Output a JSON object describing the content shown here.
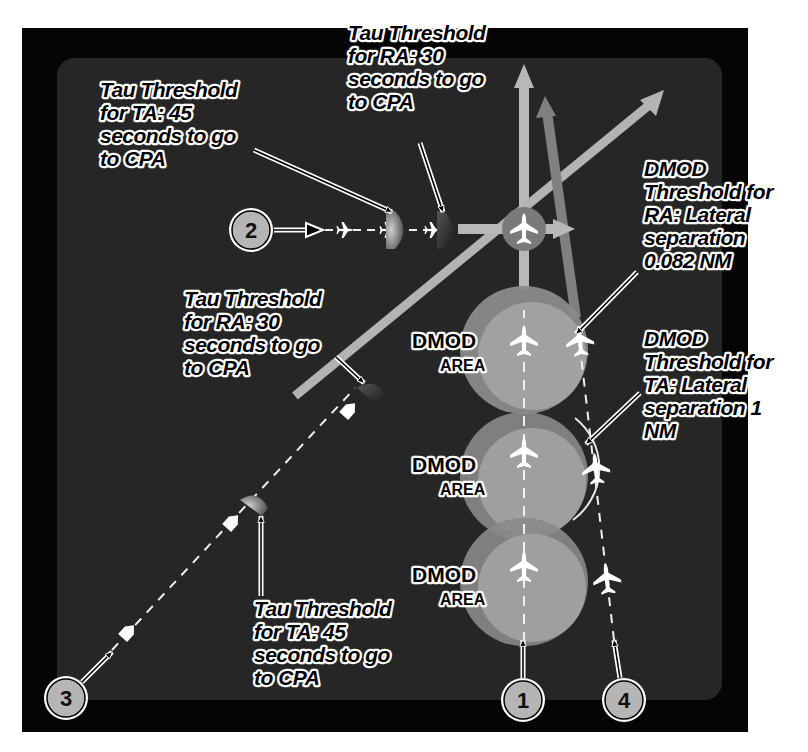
{
  "colors": {
    "outer_frame": "#050505",
    "inner_panel": "#262626",
    "track_light": "#b8b8b8",
    "track_dark": "#7a7a7a",
    "dmod_circle_outer": "#8a8a8a",
    "dmod_circle_inner": "#a2a2a2",
    "badge_fill": "#b5b5b5",
    "label_text": "#000000",
    "label_outline": "#ffffff"
  },
  "labels": {
    "tau_ta_top": [
      "Tau Threshold",
      "for TA: 45",
      "seconds to go",
      "to CPA"
    ],
    "tau_ra_top": [
      "Tau Threshold",
      "for RA: 30",
      "seconds to go",
      "to CPA"
    ],
    "dmod_ra": [
      "DMOD",
      "Threshold for",
      "RA: Lateral",
      "separation",
      "0.082 NM"
    ],
    "tau_ra_mid": [
      "Tau Threshold",
      "for RA: 30",
      "seconds to go",
      "to CPA"
    ],
    "dmod_ta": [
      "DMOD",
      "Threshold for",
      "TA: Lateral",
      "separation 1",
      "NM"
    ],
    "tau_ta_bottom": [
      "Tau Threshold",
      "for TA: 45",
      "seconds to go",
      "to CPA"
    ]
  },
  "dmod_areas": [
    {
      "line1": "DMOD",
      "line2": "AREA"
    },
    {
      "line1": "DMOD",
      "line2": "AREA"
    },
    {
      "line1": "DMOD",
      "line2": "AREA"
    }
  ],
  "badges": {
    "one": "1",
    "two": "2",
    "three": "3",
    "four": "4"
  }
}
